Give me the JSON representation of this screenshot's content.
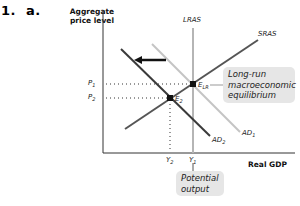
{
  "question": {
    "number": "1.",
    "part": "a."
  },
  "axes": {
    "y_label": "Aggregate price level",
    "x_label": "Real GDP"
  },
  "curves": {
    "lras": "LRAS",
    "sras": "SRAS",
    "ad1": "AD",
    "ad1_sub": "1",
    "ad2": "AD",
    "ad2_sub": "2"
  },
  "points": {
    "elr": "E",
    "elr_sub": "LR",
    "e2": "E",
    "e2_sub": "2"
  },
  "ticks": {
    "p1": "P",
    "p1_sub": "1",
    "p2": "P",
    "p2_sub": "2",
    "y1": "Y",
    "y1_sub": "1",
    "y2": "Y",
    "y2_sub": "2"
  },
  "callouts": {
    "long_run": "Long-run macroeconomic equilibrium",
    "potential": "Potential output"
  },
  "colors": {
    "ad1": "#c4c4c4",
    "ad2": "#3a3a3a",
    "sras": "#555555",
    "lras": "#b5b5b5",
    "axis": "#333333",
    "callout_bg": "#e6e6e6"
  }
}
